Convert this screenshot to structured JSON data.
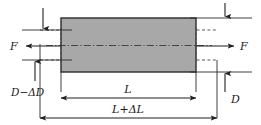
{
  "figure": {
    "type": "engineering-mechanics-diagram",
    "background_color": "#ffffff"
  },
  "specimen": {
    "name": "deformed-bar",
    "fill_color": "#a8a8a8",
    "stroke_color": "#2b2b2b",
    "x": 61,
    "y": 18,
    "width": 135,
    "height": 54
  },
  "original_outline": {
    "name": "undeformed-outline",
    "stroke_color": "#555555",
    "style": "dashed",
    "x": 40,
    "y": 30,
    "width": 177,
    "height": 30
  },
  "centerline": {
    "style": "dash-dot",
    "color": "#3a3a3a"
  },
  "labels": {
    "force_left": "F",
    "force_right": "F",
    "diameter_deformed": "D−ΔD",
    "diameter_original": "D",
    "length_original": "L",
    "length_deformed": "L+ΔL"
  },
  "dimensions": {
    "length_original": {
      "label": "L",
      "x_start": 61,
      "x_end": 196,
      "y": 88
    },
    "length_deformed": {
      "label": "L+ΔL",
      "x_start": 40,
      "x_end": 217,
      "y": 113
    },
    "diameter_deformed": {
      "label": "D−ΔD",
      "x": 31,
      "y_top": 30,
      "y_bottom": 60
    },
    "diameter_original": {
      "label": "D",
      "x": 228,
      "y_top": 18,
      "y_bottom": 72
    }
  },
  "forces": {
    "left": {
      "label": "F",
      "direction": "left",
      "y": 46,
      "x_tail": 61,
      "x_head": 24
    },
    "right": {
      "label": "F",
      "direction": "right",
      "y": 46,
      "x_tail": 196,
      "x_head": 236
    }
  }
}
